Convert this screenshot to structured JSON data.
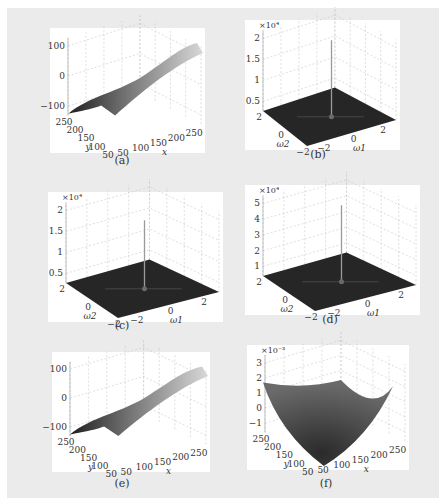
{
  "figure": {
    "panels": [
      {
        "id": "a",
        "caption": "(a)",
        "kind": "ridge",
        "zticks": [
          "100",
          "0",
          "−100"
        ],
        "xlabel": "x",
        "ylabel": "y",
        "xticks": [
          "50",
          "100",
          "150",
          "200",
          "250"
        ],
        "yticks": [
          "250",
          "200",
          "150",
          "100",
          "50"
        ],
        "exponent": ""
      },
      {
        "id": "b",
        "caption": "(b)",
        "kind": "spike",
        "zticks": [
          "2",
          "1.5",
          "1",
          "0.5"
        ],
        "xlabel": "ω1",
        "ylabel": "ω2",
        "xticks": [
          "−2",
          "0",
          "2"
        ],
        "yticks": [
          "2",
          "0",
          "−2"
        ],
        "exponent": "×10⁴",
        "peak_fraction": 0.95
      },
      {
        "id": "c",
        "caption": "(c)",
        "kind": "spike",
        "zticks": [
          "2",
          "1.5",
          "1",
          "0.5"
        ],
        "xlabel": "ω1",
        "ylabel": "ω2",
        "xticks": [
          "−2",
          "0",
          "2"
        ],
        "yticks": [
          "2",
          "0",
          "−2"
        ],
        "exponent": "×10⁴",
        "peak_fraction": 0.85
      },
      {
        "id": "d",
        "caption": "(d)",
        "kind": "spike",
        "zticks": [
          "5",
          "4",
          "3",
          "2",
          "1"
        ],
        "xlabel": "ω1",
        "ylabel": "ω2",
        "xticks": [
          "−2",
          "0",
          "2"
        ],
        "yticks": [
          "2",
          "0",
          "−2"
        ],
        "exponent": "×10⁴",
        "peak_fraction": 0.95
      },
      {
        "id": "e",
        "caption": "(e)",
        "kind": "ridge",
        "zticks": [
          "100",
          "0",
          "−100"
        ],
        "xlabel": "x",
        "ylabel": "y",
        "xticks": [
          "50",
          "100",
          "150",
          "200",
          "250"
        ],
        "yticks": [
          "250",
          "200",
          "150",
          "100",
          "50"
        ],
        "exponent": ""
      },
      {
        "id": "f",
        "caption": "(f)",
        "kind": "bowl",
        "zticks": [
          "3",
          "2",
          "1",
          "0",
          "−1"
        ],
        "xlabel": "x",
        "ylabel": "y",
        "xticks": [
          "50",
          "100",
          "150",
          "200",
          "250"
        ],
        "yticks": [
          "250",
          "200",
          "150",
          "100",
          "50"
        ],
        "exponent": "×10⁻³"
      }
    ]
  },
  "chart_data": [
    {
      "type": "surface",
      "title": "(a)",
      "xlabel": "x",
      "ylabel": "y",
      "zlabel": "",
      "xlim": [
        0,
        256
      ],
      "ylim": [
        0,
        256
      ],
      "zlim": [
        -120,
        120
      ],
      "zticks": [
        -100,
        0,
        100
      ],
      "xticks": [
        50,
        100,
        150,
        200,
        250
      ],
      "yticks": [
        50,
        100,
        150,
        200,
        250
      ],
      "description": "smooth sloped ridge surface rising from about -100 at y=250,x=0 to about 100 at x=250"
    },
    {
      "type": "surface",
      "title": "(b)",
      "xlabel": "ω1",
      "ylabel": "ω2",
      "zlim": [
        0,
        2.2
      ],
      "zscale": "x10^4",
      "zticks": [
        0.5,
        1,
        1.5,
        2
      ],
      "xticks": [
        -2,
        0,
        2
      ],
      "yticks": [
        -2,
        0,
        2
      ],
      "description": "flat spectrum with single sharp peak at origin approx 2.1e4"
    },
    {
      "type": "surface",
      "title": "(c)",
      "xlabel": "ω1",
      "ylabel": "ω2",
      "zlim": [
        0,
        2.2
      ],
      "zscale": "x10^4",
      "zticks": [
        0.5,
        1,
        1.5,
        2
      ],
      "xticks": [
        -2,
        0,
        2
      ],
      "yticks": [
        -2,
        0,
        2
      ],
      "description": "flat spectrum with single sharp peak at origin approx 1.9e4"
    },
    {
      "type": "surface",
      "title": "(d)",
      "xlabel": "ω1",
      "ylabel": "ω2",
      "zlim": [
        0,
        5.5
      ],
      "zscale": "x10^4",
      "zticks": [
        1,
        2,
        3,
        4,
        5
      ],
      "xticks": [
        -2,
        0,
        2
      ],
      "yticks": [
        -2,
        0,
        2
      ],
      "description": "flat spectrum with single sharp peak at origin approx 5.3"
    },
    {
      "type": "surface",
      "title": "(e)",
      "xlabel": "x",
      "ylabel": "y",
      "zlim": [
        -120,
        120
      ],
      "zticks": [
        -100,
        0,
        100
      ],
      "xticks": [
        50,
        100,
        150,
        200,
        250
      ],
      "yticks": [
        50,
        100,
        150,
        200,
        250
      ],
      "description": "reconstructed ridge surface similar to (a)"
    },
    {
      "type": "surface",
      "title": "(f)",
      "xlabel": "x",
      "ylabel": "y",
      "zlim": [
        -1,
        3.5
      ],
      "zscale": "x10^-3",
      "zticks": [
        -1,
        0,
        1,
        2,
        3
      ],
      "xticks": [
        50,
        100,
        150,
        200,
        250
      ],
      "yticks": [
        50,
        100,
        150,
        200,
        250
      ],
      "description": "bowl-shaped error surface, minimum near -1e-3 at front corner, max about 3.2e-3 at corners"
    }
  ]
}
